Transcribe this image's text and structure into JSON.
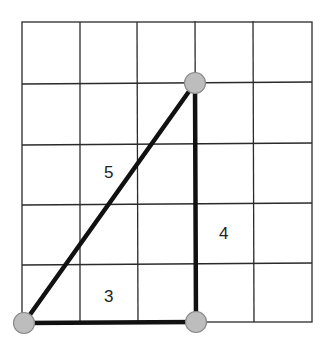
{
  "diagram": {
    "type": "right-triangle-on-grid",
    "grid": {
      "columns": 5,
      "rows": 5,
      "line_color": "#2a2a2a"
    },
    "vertices": [
      {
        "name": "bottom-left",
        "grid": [
          0,
          0
        ]
      },
      {
        "name": "bottom-right",
        "grid": [
          3,
          0
        ]
      },
      {
        "name": "top",
        "grid": [
          3,
          4
        ]
      }
    ],
    "edges": [
      {
        "name": "hypotenuse",
        "from": "bottom-left",
        "to": "top",
        "label": "5"
      },
      {
        "name": "vertical-leg",
        "from": "bottom-right",
        "to": "top",
        "label": "4"
      },
      {
        "name": "horizontal-leg",
        "from": "bottom-left",
        "to": "bottom-right",
        "label": "3"
      }
    ],
    "colors": {
      "edge": "#111111",
      "vertex_fill": "#bdbdbd",
      "vertex_stroke": "#8a8a8a"
    }
  }
}
